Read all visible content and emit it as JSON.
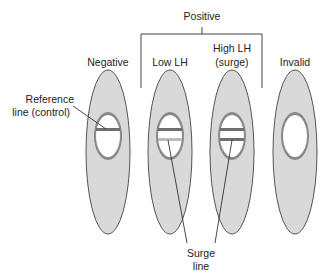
{
  "diagram": {
    "group_label": "Positive",
    "strips": [
      {
        "id": "negative",
        "label": "Negative",
        "lines": [
          "control"
        ]
      },
      {
        "id": "low-lh",
        "label": "Low LH",
        "lines": [
          "control",
          "faint-test"
        ]
      },
      {
        "id": "high-lh",
        "label_line1": "High LH",
        "label_line2": "(surge)",
        "lines": [
          "control",
          "test"
        ]
      },
      {
        "id": "invalid",
        "label": "Invalid",
        "lines": []
      }
    ],
    "callouts": {
      "reference_line1": "Reference",
      "reference_line2": "line (control)",
      "surge_line1": "Surge",
      "surge_line2": "line"
    },
    "colors": {
      "strip_fill": "#d9d9d9",
      "outline": "#555555",
      "window_fill": "#ffffff",
      "line_dark": "#6e6e6e",
      "line_faint": "#b5b5b5"
    }
  }
}
